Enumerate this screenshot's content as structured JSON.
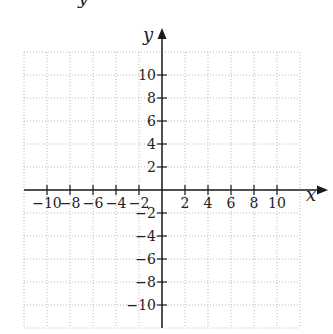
{
  "chart_data": {
    "type": "coordinate-plane",
    "title": "",
    "xlabel": "x",
    "ylabel": "y",
    "xlim": [
      -12,
      12
    ],
    "ylim": [
      -12,
      12
    ],
    "grid": true,
    "grid_step": 2,
    "grid_style": "dotted",
    "x_ticks": [
      -10,
      -8,
      -6,
      -4,
      -2,
      2,
      4,
      6,
      8,
      10
    ],
    "y_ticks": [
      -10,
      -8,
      -6,
      -4,
      -2,
      2,
      4,
      6,
      8,
      10
    ],
    "x_tick_labels": [
      "−10",
      "−8",
      "−6",
      "−4",
      "−2",
      "2",
      "4",
      "6",
      "8",
      "10"
    ],
    "y_tick_labels": [
      "−10",
      "−8",
      "−6",
      "−4",
      "−2",
      "2",
      "4",
      "6",
      "8",
      "10"
    ],
    "series": [],
    "legend": null
  },
  "labels": {
    "x_axis": "x",
    "y_axis": "y",
    "cropped_top_glyph": "y"
  },
  "colors": {
    "axis": "#1a1a1a",
    "grid": "#b8b8b8",
    "text": "#222222"
  }
}
